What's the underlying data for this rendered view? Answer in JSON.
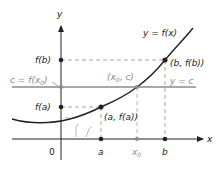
{
  "diagram": {
    "axes": {
      "x_label": "x",
      "y_label": "y",
      "origin_label": "0"
    },
    "curve": {
      "label": "y = f(x)",
      "color": "#222222"
    },
    "horizontal_line": {
      "label": "y = c",
      "left_label": "c = f(x",
      "left_label_sub": "0",
      "left_label_end": ")",
      "color": "#8a8a8a"
    },
    "y_ticks": {
      "fb": "f(b)",
      "fa": "f(a)"
    },
    "x_ticks": {
      "a": "a",
      "x0": "x",
      "x0_sub": "0",
      "b": "b"
    },
    "points": {
      "b_point": "(b, f(b))",
      "a_point": "(a, f(a))",
      "x0_point": "(x",
      "x0_point_sub": "0",
      "x0_point_end": ", c)"
    },
    "colors": {
      "ink": "#222222",
      "gray": "#8a8a8a",
      "dashed": "#9a9a9a"
    }
  }
}
